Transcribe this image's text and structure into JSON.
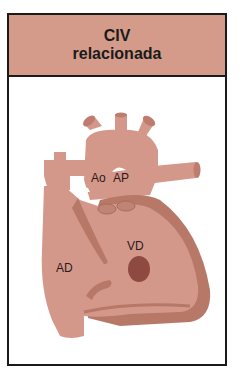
{
  "title": {
    "line1": "CIV",
    "line2": "relacionada"
  },
  "diagram": {
    "labels": {
      "ao": "Ao",
      "ap": "AP",
      "vd": "VD",
      "ad": "AD"
    }
  },
  "colors": {
    "header_bg": "#d49a8a",
    "heart_fill": "#d4988a",
    "heart_dark": "#b87868",
    "defect": "#8e4a40",
    "border": "#1a1a1a"
  }
}
